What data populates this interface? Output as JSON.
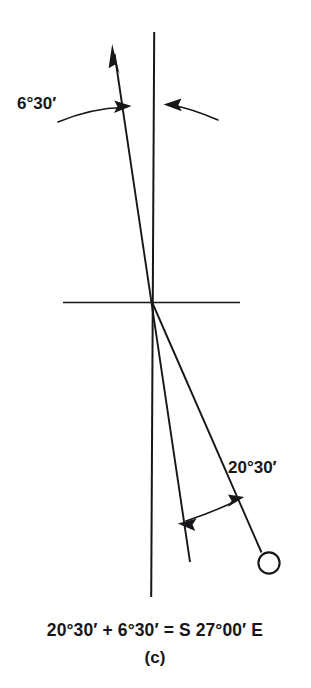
{
  "figure": {
    "label": "(c)",
    "caption": "20°30′ + 6°30′ = S 27°00′ E",
    "annotations": {
      "declination_label": "6°30′",
      "bearing_label": "20°30′"
    },
    "colors": {
      "ink": "#17171a",
      "background": "#ffffff"
    },
    "geometry": {
      "origin": {
        "x": 152,
        "y": 302
      },
      "true_meridian": {
        "x1": 154,
        "y1": 32,
        "x2": 151,
        "y2": 597
      },
      "horizontal_axis": {
        "x1": 63,
        "y1": 302,
        "x2": 240,
        "y2": 302
      },
      "magnetic_meridian": {
        "x1": 113,
        "y1": 50,
        "x2": 190,
        "y2": 562
      },
      "bearing_line": {
        "x1": 152,
        "y1": 302,
        "x2": 262,
        "y2": 552
      },
      "station_marker": {
        "cx": 269,
        "cy": 563,
        "r": 11
      },
      "declination_angle_deg": 6.5,
      "bearing_angle_deg": 20.5,
      "total_angle_deg": 27.0
    },
    "text_positions": {
      "declination_label": {
        "x": 17,
        "y": 109
      },
      "bearing_label": {
        "x": 228,
        "y": 473
      },
      "caption": {
        "x": 155,
        "y": 635
      },
      "sublabel": {
        "x": 155,
        "y": 662
      }
    }
  }
}
